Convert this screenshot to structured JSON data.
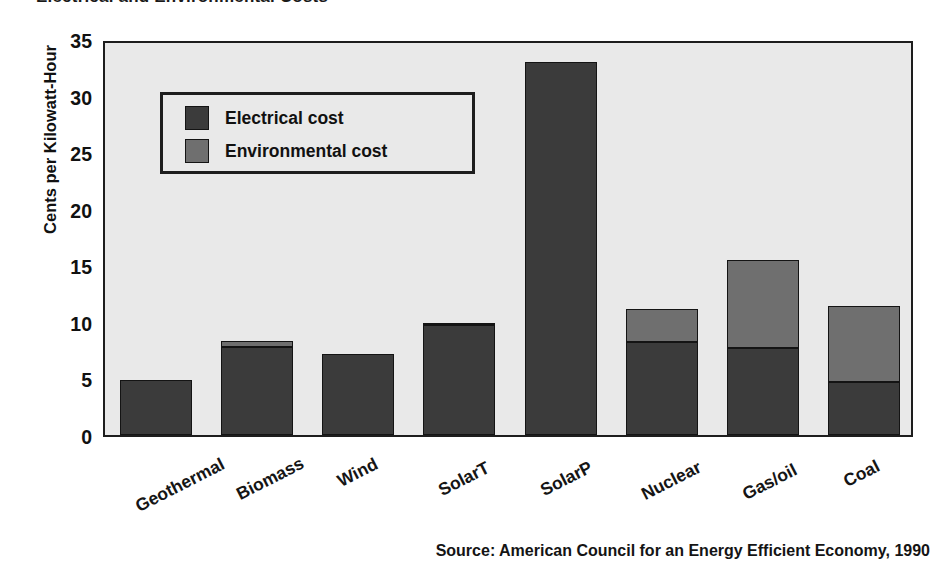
{
  "chart_data": {
    "type": "bar",
    "subtype": "stacked-bar",
    "title": "Electrical and Environmental Costs",
    "categories": [
      "Geothermal",
      "Biomass",
      "Wind",
      "SolarT",
      "SolarP",
      "Nuclear",
      "Gas/oil",
      "Coal"
    ],
    "series": [
      {
        "name": "Electrical cost",
        "color": "#3b3b3b",
        "values": [
          4.9,
          7.8,
          7.2,
          9.7,
          33.0,
          8.2,
          7.7,
          4.7
        ]
      },
      {
        "name": "Environmental cost",
        "color": "#6f6f6f",
        "values": [
          0.0,
          0.5,
          0.0,
          0.2,
          0.0,
          2.9,
          7.8,
          6.7
        ]
      }
    ],
    "totals": [
      4.9,
      8.3,
      7.2,
      9.9,
      33.0,
      11.1,
      15.5,
      11.4
    ],
    "xlabel": "",
    "ylabel": "Cents per Kilowatt-Hour",
    "ylim": [
      0,
      35
    ],
    "yticks": [
      0,
      5,
      10,
      15,
      20,
      25,
      30,
      35
    ],
    "grid": false,
    "legend_position": "inside-upper-left",
    "source": "Source: American Council for an Energy Efficient Economy, 1990"
  },
  "axis": {
    "y_title": "Cents per Kilowatt-Hour",
    "y_ticks": [
      "35",
      "30",
      "25",
      "20",
      "15",
      "10",
      "5",
      "0"
    ]
  },
  "legend": {
    "items": [
      {
        "label": "Electrical cost"
      },
      {
        "label": "Environmental cost"
      }
    ]
  },
  "colors": {
    "electrical": "#3b3b3b",
    "environmental": "#6f6f6f",
    "plot_background": "#e9e9e9",
    "frame": "#1d1d1d",
    "page_background": "#ffffff"
  },
  "footer": {
    "source": "Source: American Council for an Energy Efficient Economy, 1990"
  },
  "header": {
    "title": "Electrical and Environmental Costs"
  }
}
